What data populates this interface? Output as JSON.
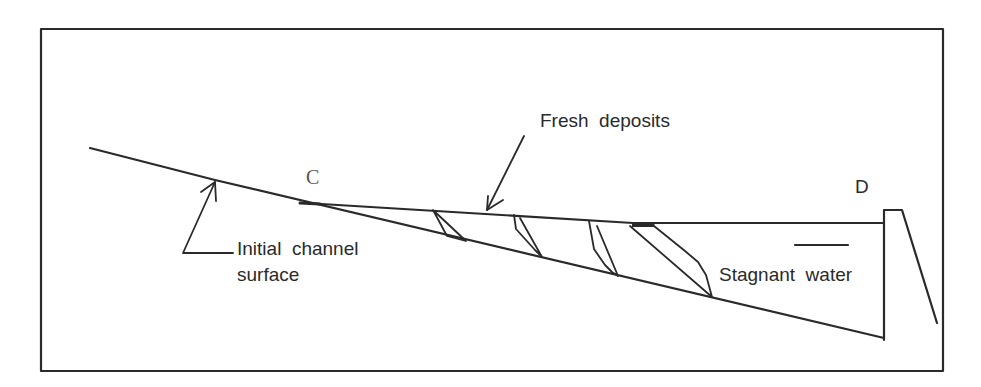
{
  "diagram": {
    "type": "channel-cross-section",
    "labels": {
      "point_c": "C",
      "point_d": "D",
      "fresh_deposits": "Fresh  deposits",
      "initial_channel_line1": "Initial  channel",
      "initial_channel_line2": "surface",
      "stagnant_water": "Stagnant  water"
    },
    "colors": {
      "line": "#2a2a2a",
      "background": "#ffffff"
    }
  }
}
